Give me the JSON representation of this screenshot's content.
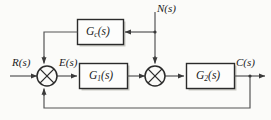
{
  "diagram": {
    "kind": "control-system-block-diagram",
    "background_color": "#fbfbf9",
    "line_color": "#555555",
    "box_border_color": "#2b2b2b",
    "box_fill_color": "#fdfdfc",
    "box_shadow_color": "#c9c9c4",
    "text_color": "#1a1a1a"
  },
  "blocks": [
    {
      "id": "gc",
      "name": "feedforward-compensator",
      "base": "G",
      "subscript": "c",
      "arg": "(s)",
      "full": "Gc(s)"
    },
    {
      "id": "g1",
      "name": "forward-block-1",
      "base": "G",
      "subscript": "1",
      "arg": "(s)",
      "full": "G1(s)"
    },
    {
      "id": "g2",
      "name": "forward-block-2",
      "base": "G",
      "subscript": "2",
      "arg": "(s)",
      "full": "G2(s)"
    }
  ],
  "signals": [
    {
      "id": "r",
      "name": "reference-input",
      "label": "R(s)"
    },
    {
      "id": "e",
      "name": "error-signal",
      "label": "E(s)"
    },
    {
      "id": "n",
      "name": "disturbance-input",
      "label": "N(s)"
    },
    {
      "id": "c",
      "name": "controlled-output",
      "label": "C(s)"
    }
  ],
  "junctions": [
    {
      "id": "sum1",
      "name": "summing-junction-1",
      "glyph": "cross-circle",
      "inputs": [
        "left",
        "top",
        "bottom"
      ],
      "output": "right"
    },
    {
      "id": "sum2",
      "name": "summing-junction-2",
      "glyph": "cross-circle",
      "inputs": [
        "left",
        "top"
      ],
      "output": "right"
    }
  ],
  "paths": [
    {
      "id": "r-to-sum1",
      "name": "reference-path"
    },
    {
      "id": "sum1-to-g1",
      "name": "error-path"
    },
    {
      "id": "g1-to-sum2",
      "name": "g1-output-path"
    },
    {
      "id": "sum2-to-g2",
      "name": "sum2-output-path"
    },
    {
      "id": "g2-to-c",
      "name": "output-path"
    },
    {
      "id": "n-branch-to-gc",
      "name": "disturbance-to-compensator-path"
    },
    {
      "id": "n-branch-to-sum2",
      "name": "disturbance-to-sum2-path"
    },
    {
      "id": "gc-to-sum1",
      "name": "compensator-feedforward-path"
    },
    {
      "id": "c-to-sum1",
      "name": "unity-feedback-path"
    }
  ]
}
